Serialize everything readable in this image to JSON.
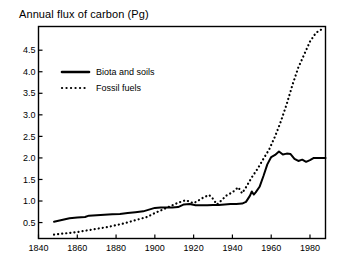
{
  "chart_data": {
    "type": "line",
    "title": "Annual flux of carbon (Pg)",
    "xlabel": "",
    "ylabel": "",
    "xlim": [
      1840,
      1988
    ],
    "ylim": [
      0.13,
      5.05
    ],
    "grid": false,
    "legend_position": "upper-left-inside",
    "xticks": [
      1840,
      1860,
      1880,
      1900,
      1920,
      1940,
      1960,
      1980
    ],
    "xtick_labels": [
      "1840",
      "1860",
      "1880",
      "1900",
      "1920",
      "1940",
      "1960",
      "1980"
    ],
    "yticks": [
      0.5,
      1.0,
      1.5,
      2.0,
      2.5,
      3.0,
      3.5,
      4.0,
      4.5
    ],
    "ytick_labels": [
      "0.5",
      "1.0",
      "1.5",
      "2.0",
      "2.5",
      "3.0",
      "3.5",
      "4.0",
      "4.5"
    ],
    "series": [
      {
        "name": "Biota and soils",
        "style": "solid",
        "color": "#000000",
        "x": [
          1848,
          1852,
          1856,
          1860,
          1864,
          1866,
          1870,
          1874,
          1878,
          1882,
          1886,
          1890,
          1894,
          1897,
          1900,
          1903,
          1906,
          1909,
          1912,
          1915,
          1918,
          1921,
          1924,
          1927,
          1930,
          1933,
          1936,
          1939,
          1942,
          1945,
          1947,
          1949,
          1950,
          1951,
          1952,
          1954,
          1956,
          1958,
          1960,
          1962,
          1964,
          1966,
          1968,
          1970,
          1972,
          1974,
          1976,
          1978,
          1980,
          1982,
          1985,
          1988
        ],
        "y": [
          0.52,
          0.56,
          0.6,
          0.62,
          0.63,
          0.66,
          0.67,
          0.68,
          0.69,
          0.7,
          0.72,
          0.74,
          0.76,
          0.8,
          0.84,
          0.85,
          0.85,
          0.85,
          0.86,
          0.92,
          0.93,
          0.9,
          0.9,
          0.9,
          0.91,
          0.91,
          0.92,
          0.93,
          0.93,
          0.94,
          0.98,
          1.12,
          1.22,
          1.15,
          1.2,
          1.33,
          1.58,
          1.85,
          2.02,
          2.07,
          2.15,
          2.08,
          2.1,
          2.09,
          1.98,
          1.93,
          1.96,
          1.91,
          1.95,
          2.0,
          2.0,
          2.0
        ]
      },
      {
        "name": "Fossil fuels",
        "style": "dotted",
        "color": "#000000",
        "x": [
          1848,
          1852,
          1856,
          1860,
          1864,
          1868,
          1872,
          1876,
          1880,
          1884,
          1888,
          1892,
          1896,
          1900,
          1904,
          1908,
          1912,
          1916,
          1918,
          1920,
          1922,
          1925,
          1928,
          1930,
          1932,
          1934,
          1937,
          1940,
          1943,
          1945,
          1947,
          1950,
          1953,
          1956,
          1959,
          1962,
          1965,
          1968,
          1971,
          1974,
          1977,
          1980,
          1983,
          1985,
          1987
        ],
        "y": [
          0.22,
          0.24,
          0.26,
          0.28,
          0.31,
          0.34,
          0.37,
          0.4,
          0.44,
          0.48,
          0.53,
          0.58,
          0.63,
          0.72,
          0.8,
          0.88,
          0.96,
          1.02,
          0.98,
          0.95,
          1.0,
          1.08,
          1.14,
          1.05,
          0.92,
          1.0,
          1.13,
          1.2,
          1.32,
          1.18,
          1.32,
          1.55,
          1.75,
          1.98,
          2.2,
          2.5,
          2.85,
          3.25,
          3.7,
          4.1,
          4.4,
          4.7,
          4.9,
          4.96,
          5.0
        ]
      }
    ]
  },
  "legend": {
    "items": [
      {
        "label": "Biota and soils",
        "style": "solid"
      },
      {
        "label": "Fossil fuels",
        "style": "dotted"
      }
    ]
  }
}
